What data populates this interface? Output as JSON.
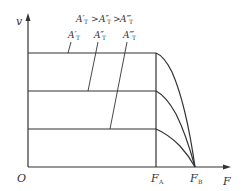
{
  "diagram": {
    "axes": {
      "y_label": "v",
      "x_label": "F",
      "origin_label": "O"
    },
    "x_ticks": [
      {
        "label": "F",
        "sub": "A"
      },
      {
        "label": "F",
        "sub": "B"
      }
    ],
    "relation": {
      "text_a": "A′",
      "text_b": "A″",
      "text_c": "A‴",
      "sub": "T",
      "gt": ">"
    },
    "curves": [
      {
        "name": "A′T",
        "label": "A′",
        "sub": "T"
      },
      {
        "name": "A″T",
        "label": "A″",
        "sub": "T"
      },
      {
        "name": "A‴T",
        "label": "A‴",
        "sub": "T"
      }
    ],
    "colors": {
      "line": "#333333",
      "background": "#ffffff"
    }
  }
}
